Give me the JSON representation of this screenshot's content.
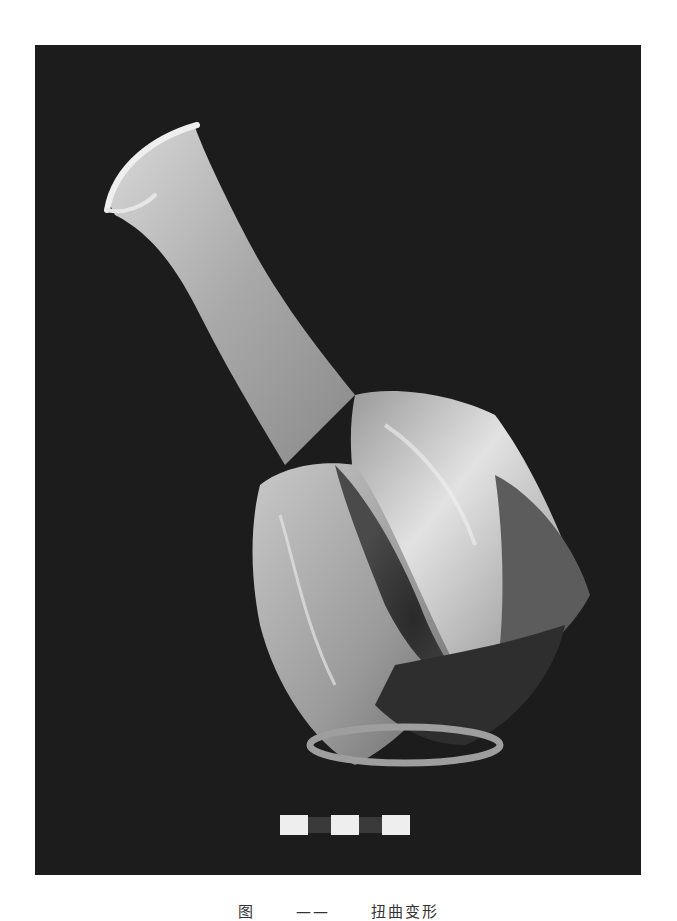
{
  "figure": {
    "background_color": "#1c1c1c",
    "vessel_color": "#bdbdbd",
    "scale_bar": {
      "segments": 5,
      "pattern": [
        "white",
        "dark",
        "white",
        "dark",
        "white"
      ]
    },
    "caption": {
      "prefix": "图",
      "number": "——",
      "text": "扭曲变形"
    }
  }
}
